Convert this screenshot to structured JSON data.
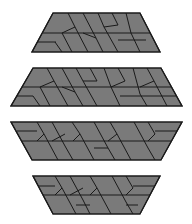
{
  "figure": {
    "fill_color": "#7a7a7a",
    "fill_color_alt": "#6e6e6e",
    "stroke_color": "#1a1a1a",
    "background": "#ffffff"
  },
  "shapes": [
    {
      "name": "trapezoid-1",
      "outline": [
        [
          53,
          13
        ],
        [
          140,
          13
        ],
        [
          160,
          52
        ],
        [
          32,
          52
        ]
      ],
      "lines": [
        [
          [
            43,
            33
          ],
          [
            150,
            33
          ]
        ],
        [
          [
            37,
            42
          ],
          [
            56,
            42
          ]
        ],
        [
          [
            68,
            13
          ],
          [
            75,
            27
          ]
        ],
        [
          [
            83,
            13
          ],
          [
            96,
            38
          ]
        ],
        [
          [
            96,
            38
          ],
          [
            103,
            52
          ]
        ],
        [
          [
            62,
            33
          ],
          [
            72,
            52
          ]
        ],
        [
          [
            75,
            27
          ],
          [
            62,
            33
          ]
        ],
        [
          [
            98,
            13
          ],
          [
            104,
            27
          ]
        ],
        [
          [
            112,
            13
          ],
          [
            118,
            25
          ]
        ],
        [
          [
            118,
            25
          ],
          [
            104,
            27
          ]
        ],
        [
          [
            104,
            27
          ],
          [
            118,
            52
          ]
        ],
        [
          [
            126,
            13
          ],
          [
            131,
            33
          ]
        ],
        [
          [
            131,
            33
          ],
          [
            140,
            52
          ]
        ],
        [
          [
            83,
            33
          ],
          [
            96,
            38
          ]
        ],
        [
          [
            118,
            40
          ],
          [
            146,
            40
          ]
        ],
        [
          [
            75,
            27
          ],
          [
            88,
            52
          ]
        ],
        [
          [
            55,
            42
          ],
          [
            62,
            52
          ]
        ]
      ]
    },
    {
      "name": "trapezoid-2",
      "outline": [
        [
          33,
          68
        ],
        [
          161,
          68
        ],
        [
          182,
          106
        ],
        [
          11,
          106
        ]
      ],
      "lines": [
        [
          [
            22,
            87
          ],
          [
            171,
            87
          ]
        ],
        [
          [
            16,
            96
          ],
          [
            33,
            96
          ]
        ],
        [
          [
            47,
            68
          ],
          [
            54,
            81
          ]
        ],
        [
          [
            54,
            81
          ],
          [
            40,
            87
          ]
        ],
        [
          [
            54,
            81
          ],
          [
            68,
            106
          ]
        ],
        [
          [
            62,
            68
          ],
          [
            75,
            92
          ]
        ],
        [
          [
            75,
            92
          ],
          [
            83,
            106
          ]
        ],
        [
          [
            62,
            87
          ],
          [
            75,
            92
          ]
        ],
        [
          [
            40,
            87
          ],
          [
            50,
            106
          ]
        ],
        [
          [
            76,
            68
          ],
          [
            83,
            81
          ]
        ],
        [
          [
            90,
            68
          ],
          [
            97,
            81
          ]
        ],
        [
          [
            97,
            81
          ],
          [
            83,
            81
          ]
        ],
        [
          [
            83,
            81
          ],
          [
            97,
            106
          ]
        ],
        [
          [
            104,
            68
          ],
          [
            111,
            87
          ]
        ],
        [
          [
            111,
            87
          ],
          [
            120,
            106
          ]
        ],
        [
          [
            118,
            68
          ],
          [
            125,
            81
          ]
        ],
        [
          [
            125,
            81
          ],
          [
            111,
            87
          ]
        ],
        [
          [
            133,
            68
          ],
          [
            140,
            94
          ]
        ],
        [
          [
            140,
            94
          ],
          [
            147,
            106
          ]
        ],
        [
          [
            147,
            68
          ],
          [
            154,
            81
          ]
        ],
        [
          [
            154,
            81
          ],
          [
            140,
            87
          ]
        ],
        [
          [
            154,
            81
          ],
          [
            167,
            106
          ]
        ],
        [
          [
            120,
            96
          ],
          [
            177,
            96
          ]
        ],
        [
          [
            33,
            96
          ],
          [
            40,
            106
          ]
        ]
      ]
    },
    {
      "name": "trapezoid-3",
      "outline": [
        [
          11,
          122
        ],
        [
          182,
          122
        ],
        [
          161,
          160
        ],
        [
          32,
          160
        ]
      ],
      "lines": [
        [
          [
            22,
            141
          ],
          [
            171,
            141
          ]
        ],
        [
          [
            17,
            131
          ],
          [
            37,
            131
          ]
        ],
        [
          [
            37,
            122
          ],
          [
            44,
            134
          ]
        ],
        [
          [
            44,
            134
          ],
          [
            37,
            141
          ]
        ],
        [
          [
            44,
            134
          ],
          [
            58,
            160
          ]
        ],
        [
          [
            52,
            122
          ],
          [
            65,
            146
          ]
        ],
        [
          [
            65,
            146
          ],
          [
            73,
            160
          ]
        ],
        [
          [
            65,
            134
          ],
          [
            52,
            141
          ]
        ],
        [
          [
            72,
            122
          ],
          [
            80,
            134
          ]
        ],
        [
          [
            80,
            134
          ],
          [
            73,
            141
          ]
        ],
        [
          [
            80,
            134
          ],
          [
            94,
            160
          ]
        ],
        [
          [
            94,
            122
          ],
          [
            108,
            148
          ]
        ],
        [
          [
            108,
            148
          ],
          [
            115,
            160
          ]
        ],
        [
          [
            110,
            122
          ],
          [
            117,
            134
          ]
        ],
        [
          [
            117,
            134
          ],
          [
            108,
            141
          ]
        ],
        [
          [
            117,
            134
          ],
          [
            131,
            160
          ]
        ],
        [
          [
            134,
            122
          ],
          [
            148,
            148
          ]
        ],
        [
          [
            148,
            122
          ],
          [
            155,
            134
          ]
        ],
        [
          [
            155,
            134
          ],
          [
            148,
            141
          ]
        ],
        [
          [
            148,
            148
          ],
          [
            155,
            160
          ]
        ],
        [
          [
            155,
            131
          ],
          [
            177,
            131
          ]
        ],
        [
          [
            94,
            148
          ],
          [
            108,
            148
          ]
        ]
      ]
    },
    {
      "name": "trapezoid-4",
      "outline": [
        [
          33,
          176
        ],
        [
          160,
          176
        ],
        [
          140,
          214
        ],
        [
          53,
          214
        ]
      ],
      "lines": [
        [
          [
            43,
            195
          ],
          [
            150,
            195
          ]
        ],
        [
          [
            38,
            186
          ],
          [
            55,
            186
          ]
        ],
        [
          [
            55,
            176
          ],
          [
            62,
            188
          ]
        ],
        [
          [
            62,
            188
          ],
          [
            55,
            195
          ]
        ],
        [
          [
            62,
            188
          ],
          [
            76,
            214
          ]
        ],
        [
          [
            70,
            176
          ],
          [
            83,
            200
          ]
        ],
        [
          [
            83,
            200
          ],
          [
            90,
            214
          ]
        ],
        [
          [
            83,
            188
          ],
          [
            70,
            195
          ]
        ],
        [
          [
            90,
            176
          ],
          [
            97,
            188
          ]
        ],
        [
          [
            97,
            188
          ],
          [
            90,
            195
          ]
        ],
        [
          [
            97,
            188
          ],
          [
            111,
            214
          ]
        ],
        [
          [
            112,
            176
          ],
          [
            126,
            202
          ]
        ],
        [
          [
            126,
            202
          ],
          [
            133,
            214
          ]
        ],
        [
          [
            126,
            176
          ],
          [
            133,
            188
          ]
        ],
        [
          [
            133,
            188
          ],
          [
            126,
            195
          ]
        ],
        [
          [
            133,
            186
          ],
          [
            155,
            186
          ]
        ],
        [
          [
            76,
            205
          ],
          [
            90,
            205
          ]
        ],
        [
          [
            126,
            205
          ],
          [
            138,
            205
          ]
        ]
      ]
    }
  ]
}
